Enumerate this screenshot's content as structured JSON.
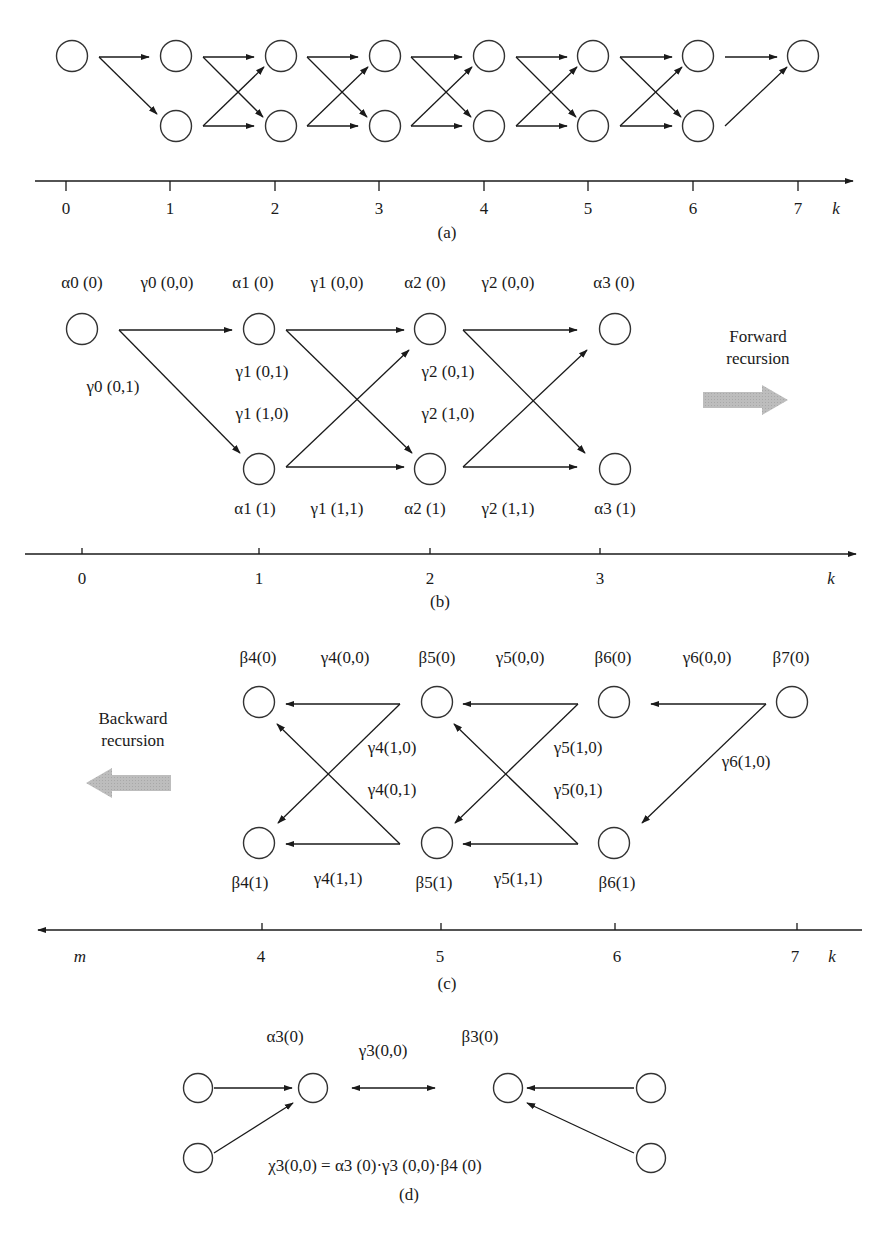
{
  "panel_a": {
    "caption": "(a)",
    "axis_ticks": [
      "0",
      "1",
      "2",
      "3",
      "4",
      "5",
      "6",
      "7"
    ],
    "axis_label": "k"
  },
  "panel_b": {
    "caption": "(b)",
    "top_labels": {
      "a0_0": "α0 (0)",
      "g0_00": "γ0 (0,0)",
      "a1_0": "α1 (0)",
      "g1_00": "γ1 (0,0)",
      "a2_0": "α2 (0)",
      "g2_00": "γ2 (0,0)",
      "a3_0": "α3 (0)"
    },
    "mid_labels": {
      "g0_01": "γ0 (0,1)",
      "g1_01": "γ1 (0,1)",
      "g1_10": "γ1 (1,0)",
      "g2_01": "γ2 (0,1)",
      "g2_10": "γ2 (1,0)"
    },
    "bottom_labels": {
      "a1_1": "α1 (1)",
      "g1_11": "γ1 (1,1)",
      "a2_1": "α2 (1)",
      "g2_11": "γ2 (1,1)",
      "a3_1": "α3 (1)"
    },
    "direction_label_line1": "Forward",
    "direction_label_line2": "recursion",
    "axis_ticks": [
      "0",
      "1",
      "2",
      "3"
    ],
    "axis_label": "k"
  },
  "panel_c": {
    "caption": "(c)",
    "top_labels": {
      "b4_0": "β4(0)",
      "g4_00": "γ4(0,0)",
      "b5_0": "β5(0)",
      "g5_00": "γ5(0,0)",
      "b6_0": "β6(0)",
      "g6_00": "γ6(0,0)",
      "b7_0": "β7(0)"
    },
    "mid_labels": {
      "g4_10": "γ4(1,0)",
      "g4_01": "γ4(0,1)",
      "g5_10": "γ5(1,0)",
      "g5_01": "γ5(0,1)",
      "g6_10": "γ6(1,0)"
    },
    "bottom_labels": {
      "b4_1": "β4(1)",
      "g4_11": "γ4(1,1)",
      "b5_1": "β5(1)",
      "g5_11": "γ5(1,1)",
      "b6_1": "β6(1)"
    },
    "direction_label_line1": "Backward",
    "direction_label_line2": "recursion",
    "axis_ticks": [
      "4",
      "5",
      "6",
      "7"
    ],
    "axis_start_label": "m",
    "axis_label": "k"
  },
  "panel_d": {
    "caption": "(d)",
    "alpha_label": "α3(0)",
    "gamma_label": "γ3(0,0)",
    "beta_label": "β3(0)",
    "formula": "χ3(0,0) = α3 (0)·γ3 (0,0)·β4 (0)"
  },
  "colors": {
    "ink": "#1a1a1a",
    "node_stroke": "#333333",
    "recursion_arrow": "#b3b3b3"
  }
}
